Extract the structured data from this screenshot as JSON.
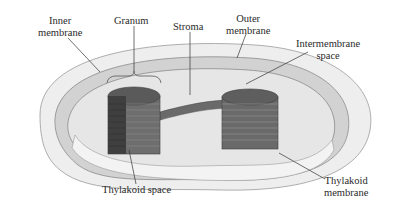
{
  "diagram": {
    "labels": {
      "inner_membrane": [
        "Inner",
        "membrane"
      ],
      "granum": [
        "Granum"
      ],
      "stroma": [
        "Stroma"
      ],
      "outer_membrane": [
        "Outer",
        "membrane"
      ],
      "intermembrane_space": [
        "Intermembrane",
        "space"
      ],
      "thylakoid_space": [
        "Thylakoid space"
      ],
      "thylakoid_membrane": [
        "Thylakoid",
        "membrane"
      ]
    },
    "colors": {
      "outer_shell": "#ececec",
      "inner_fill": "#e4e4e4",
      "membrane_band": "#c8c8c8",
      "granum_dark": "#4a4a4a",
      "granum_mid": "#6e6e6e",
      "leader_line": "#333333"
    }
  }
}
